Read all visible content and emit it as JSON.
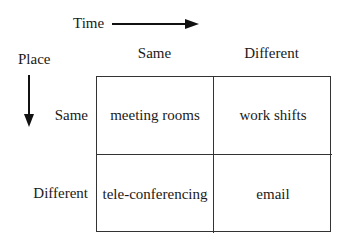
{
  "axes": {
    "time": {
      "label": "Time",
      "direction": "right"
    },
    "place": {
      "label": "Place",
      "direction": "down"
    }
  },
  "columns": [
    {
      "label": "Same"
    },
    {
      "label": "Different"
    }
  ],
  "rows": [
    {
      "label": "Same"
    },
    {
      "label": "Different"
    }
  ],
  "cells": [
    [
      "meeting rooms",
      "work shifts"
    ],
    [
      "tele-conferencing",
      "email"
    ]
  ],
  "colors": {
    "line": "#333333",
    "text": "#1a1a1a",
    "background": "#ffffff"
  }
}
